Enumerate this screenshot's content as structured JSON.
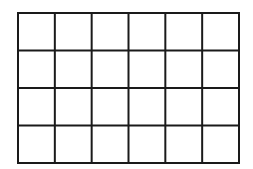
{
  "diagram": {
    "type": "grid",
    "columns": 6,
    "rows": 4,
    "line_color": "#1a1a1a",
    "background": "#ffffff",
    "bounds": {
      "left": 18,
      "top": 13,
      "right": 239,
      "bottom": 163
    },
    "line_width": 2
  }
}
